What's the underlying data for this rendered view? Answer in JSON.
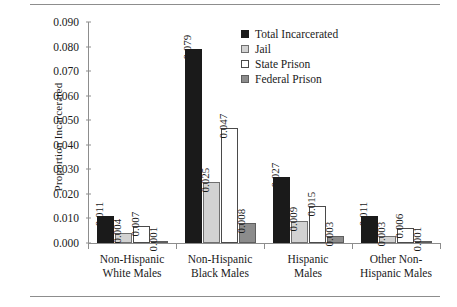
{
  "chart_data": {
    "type": "bar",
    "title": "",
    "xlabel": "",
    "ylabel": "Proportion Incarcerated",
    "ylim": [
      0,
      0.09
    ],
    "grid": false,
    "legend_position": "top-center-right",
    "ytick_labels": [
      "0.090",
      "0.080",
      "0.070",
      "0.060",
      "0.050",
      "0.040",
      "0.030",
      "0.020",
      "0.010",
      "0.000"
    ],
    "ytick_values": [
      0.09,
      0.08,
      0.07,
      0.06,
      0.05,
      0.04,
      0.03,
      0.02,
      0.01,
      0.0
    ],
    "categories": [
      "Non-Hispanic White Males",
      "Non-Hispanic Black Males",
      "Hispanic Males",
      "Other Non-Hispanic Males"
    ],
    "category_lines": [
      [
        "Non-Hispanic",
        "White Males"
      ],
      [
        "Non-Hispanic",
        "Black Males"
      ],
      [
        "Hispanic",
        "Males"
      ],
      [
        "Other Non-",
        "Hispanic Males"
      ]
    ],
    "series": [
      {
        "name": "Total Incarcerated",
        "color": "#1a1a1a",
        "values": [
          0.011,
          0.079,
          0.027,
          0.011
        ],
        "labels": [
          "0.011",
          "0.079",
          "0.027",
          "0.011"
        ]
      },
      {
        "name": "Jail",
        "color": "#d2d2d2",
        "values": [
          0.004,
          0.025,
          0.009,
          0.003
        ],
        "labels": [
          "0.004",
          "0.025",
          "0.009",
          "0.003"
        ]
      },
      {
        "name": "State Prison",
        "color": "#ffffff",
        "values": [
          0.007,
          0.047,
          0.015,
          0.006
        ],
        "labels": [
          "0.007",
          "0.047",
          "0.015",
          "0.006"
        ]
      },
      {
        "name": "Federal Prison",
        "color": "#8c8c8c",
        "values": [
          0.001,
          0.008,
          0.003,
          0.001
        ],
        "labels": [
          "0.001",
          "0.008",
          "0.003",
          "0.001"
        ]
      }
    ]
  }
}
